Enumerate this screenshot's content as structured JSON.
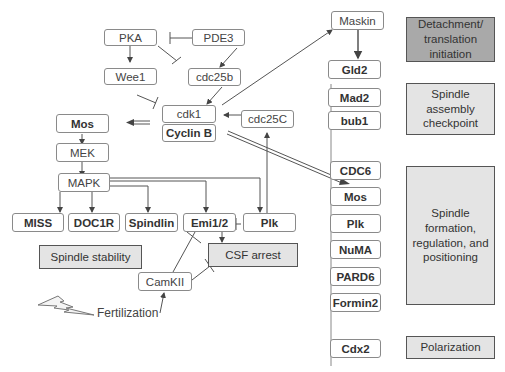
{
  "pathway": {
    "pka": "PKA",
    "pde3": "PDE3",
    "wee1": "Wee1",
    "cdc25b": "cdc25b",
    "cdk1": "cdk1",
    "cyclin_b": "Cyclin B",
    "cdc25c": "cdc25C",
    "mos": "Mos",
    "mek": "MEK",
    "mapk": "MAPK",
    "miss": "MISS",
    "doc1r": "DOC1R",
    "spindlin": "Spindlin",
    "emi12": "Emi1/2",
    "plk": "Plk",
    "spindle_stability": "Spindle stability",
    "csf_arrest": "CSF arrest",
    "camkii": "CamKII",
    "fertilization": "Fertilization",
    "maskin": "Maskin"
  },
  "targets": {
    "gld2": "Gld2",
    "mad2": "Mad2",
    "bub1": "bub1",
    "cdc6": "CDC6",
    "mos": "Mos",
    "plk": "Plk",
    "numa": "NuMA",
    "pard6": "PARD6",
    "formin2": "Formin2",
    "cdx2": "Cdx2"
  },
  "functions": {
    "detachment": [
      "Detachment/",
      "translation",
      "initiation"
    ],
    "sac": [
      "Spindle",
      "assembly",
      "checkpoint"
    ],
    "spindle_formation": [
      "Spindle",
      "formation,",
      "regulation, and",
      "positioning"
    ],
    "polarization": [
      "Polarization"
    ]
  },
  "colors": {
    "dark_box": "#a9a9a9",
    "light_box": "#e4e4e4",
    "line": "#555555"
  }
}
